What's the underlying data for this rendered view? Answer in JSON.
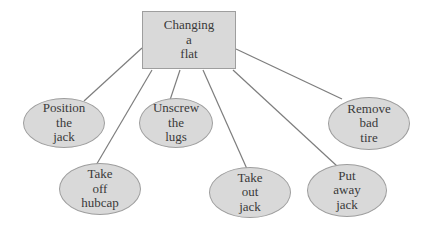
{
  "diagram": {
    "title": "Changing a flat",
    "type": "cluster-map",
    "root": {
      "id": "changing-a-flat",
      "shape": "rectangle",
      "label": "Changing\na\nflat"
    },
    "nodes": [
      {
        "id": "position-the-jack",
        "shape": "ellipse",
        "label": "Position\nthe\njack"
      },
      {
        "id": "take-off-hubcap",
        "shape": "ellipse",
        "label": "Take\noff\nhubcap"
      },
      {
        "id": "unscrew-the-lugs",
        "shape": "ellipse",
        "label": "Unscrew\nthe\nlugs"
      },
      {
        "id": "take-out-jack",
        "shape": "ellipse",
        "label": "Take\nout\njack"
      },
      {
        "id": "put-away-jack",
        "shape": "ellipse",
        "label": "Put\naway\njack"
      },
      {
        "id": "remove-bad-tire",
        "shape": "ellipse",
        "label": "Remove\nbad\ntire"
      }
    ],
    "edges": [
      {
        "from": "changing-a-flat",
        "to": "position-the-jack",
        "x1": 142,
        "y1": 48,
        "x2": 84,
        "y2": 101
      },
      {
        "from": "changing-a-flat",
        "to": "take-off-hubcap",
        "x1": 152,
        "y1": 70,
        "x2": 95,
        "y2": 167
      },
      {
        "from": "changing-a-flat",
        "to": "unscrew-the-lugs",
        "x1": 180,
        "y1": 70,
        "x2": 170,
        "y2": 100
      },
      {
        "from": "changing-a-flat",
        "to": "take-out-jack",
        "x1": 203,
        "y1": 70,
        "x2": 247,
        "y2": 169
      },
      {
        "from": "changing-a-flat",
        "to": "put-away-jack",
        "x1": 233,
        "y1": 70,
        "x2": 337,
        "y2": 166
      },
      {
        "from": "changing-a-flat",
        "to": "remove-bad-tire",
        "x1": 236,
        "y1": 49,
        "x2": 342,
        "y2": 99
      }
    ],
    "colors": {
      "background": "#ffffff",
      "node_fill": "#d9d9d9",
      "node_border": "#9e9e9e",
      "edge": "#7d7d7d",
      "text": "#3a3a3a"
    }
  }
}
